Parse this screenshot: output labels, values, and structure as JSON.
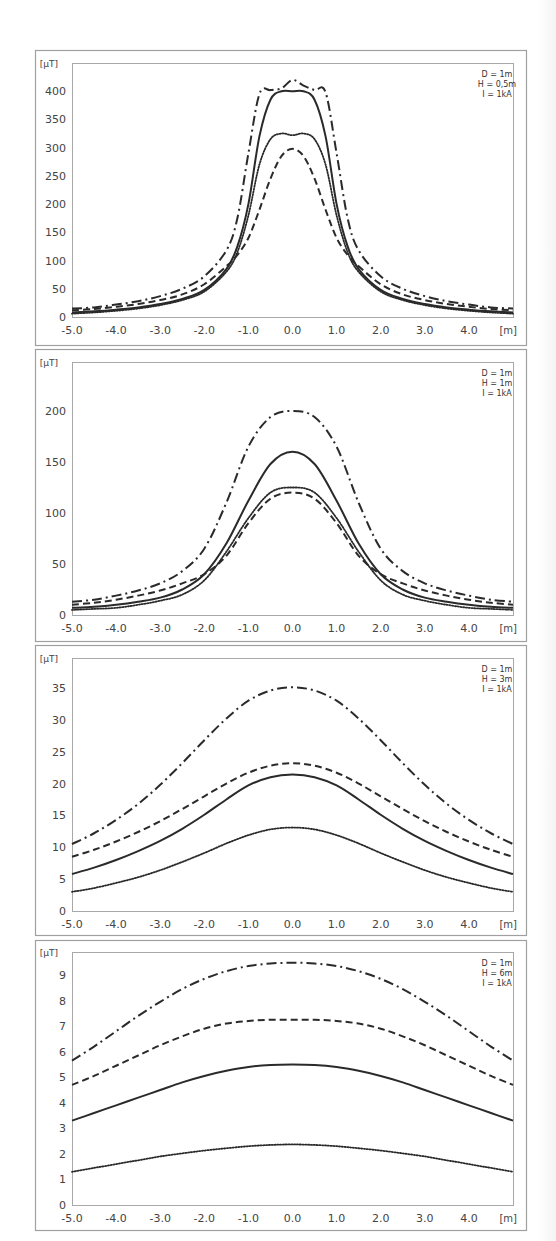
{
  "figure": {
    "unit_y": "[µT]",
    "unit_x": "[m]"
  },
  "chart_data": [
    {
      "type": "line",
      "title": "",
      "xlabel": "[m]",
      "ylabel": "[µT]",
      "annotation": [
        "D = 1m",
        "H = 0,5m",
        "I = 1kA"
      ],
      "xlim": [
        -5.0,
        5.0
      ],
      "ylim": [
        0,
        450
      ],
      "xticks": [
        "-5.0",
        "-4.0",
        "-3.0",
        "-2.0",
        "-1.0",
        "0.0",
        "1.0",
        "2.0",
        "3.0",
        "4.0"
      ],
      "yticks": [
        "0",
        "50",
        "100",
        "150",
        "200",
        "250",
        "300",
        "350",
        "400"
      ],
      "ytick_values": [
        0,
        50,
        100,
        150,
        200,
        250,
        300,
        350,
        400
      ],
      "grid": false,
      "legend": "none",
      "x": [
        -5.0,
        -4.5,
        -4.0,
        -3.5,
        -3.0,
        -2.5,
        -2.0,
        -1.5,
        -1.25,
        -1.0,
        -0.75,
        -0.5,
        -0.25,
        0.0,
        0.25,
        0.5,
        0.75,
        1.0,
        1.25,
        1.5,
        2.0,
        2.5,
        3.0,
        3.5,
        4.0,
        4.5,
        5.0
      ],
      "series": [
        {
          "name": "dash-dot",
          "style": "dashdot",
          "values": [
            15,
            17,
            22,
            28,
            37,
            50,
            72,
            118,
            175,
            290,
            395,
            402,
            405,
            420,
            410,
            402,
            398,
            290,
            175,
            118,
            72,
            50,
            37,
            28,
            22,
            17,
            15
          ]
        },
        {
          "name": "solid",
          "style": "solid",
          "values": [
            8,
            10,
            13,
            17,
            23,
            32,
            48,
            85,
            125,
            200,
            320,
            385,
            400,
            400,
            400,
            385,
            320,
            200,
            125,
            85,
            48,
            32,
            23,
            17,
            13,
            10,
            8
          ]
        },
        {
          "name": "dotted",
          "style": "dotted",
          "values": [
            6,
            8,
            11,
            15,
            21,
            30,
            45,
            80,
            115,
            180,
            270,
            315,
            325,
            322,
            325,
            315,
            270,
            180,
            115,
            80,
            45,
            30,
            21,
            15,
            11,
            8,
            6
          ]
        },
        {
          "name": "dashed",
          "style": "dashed",
          "values": [
            12,
            14,
            18,
            23,
            30,
            40,
            58,
            90,
            110,
            140,
            190,
            245,
            285,
            298,
            285,
            245,
            190,
            140,
            110,
            90,
            58,
            40,
            30,
            23,
            18,
            14,
            12
          ]
        }
      ]
    },
    {
      "type": "line",
      "title": "",
      "xlabel": "[m]",
      "ylabel": "[µT]",
      "annotation": [
        "D = 1m",
        "H = 1m",
        "I = 1kA"
      ],
      "xlim": [
        -5.0,
        5.0
      ],
      "ylim": [
        0,
        248
      ],
      "xticks": [
        "-5.0",
        "-4.0",
        "-3.0",
        "-2.0",
        "-1.0",
        "0.0",
        "1.0",
        "2.0",
        "3.0",
        "4.0"
      ],
      "yticks": [
        "0",
        "50",
        "100",
        "150",
        "200"
      ],
      "ytick_values": [
        0,
        50,
        100,
        150,
        200
      ],
      "grid": false,
      "legend": "none",
      "x": [
        -5.0,
        -4.5,
        -4.0,
        -3.5,
        -3.0,
        -2.5,
        -2.0,
        -1.5,
        -1.0,
        -0.5,
        0.0,
        0.5,
        1.0,
        1.5,
        2.0,
        2.5,
        3.0,
        3.5,
        4.0,
        4.5,
        5.0
      ],
      "series": [
        {
          "name": "dash-dot",
          "style": "dashdot",
          "values": [
            13,
            15,
            19,
            24,
            31,
            43,
            65,
            110,
            165,
            194,
            200,
            194,
            165,
            110,
            65,
            43,
            31,
            24,
            19,
            15,
            13
          ]
        },
        {
          "name": "solid",
          "style": "solid",
          "values": [
            7,
            8,
            10,
            13,
            17,
            25,
            40,
            70,
            112,
            148,
            160,
            148,
            112,
            70,
            40,
            25,
            17,
            13,
            10,
            8,
            7
          ]
        },
        {
          "name": "dotted",
          "style": "dotted",
          "values": [
            5,
            6,
            7,
            10,
            14,
            20,
            34,
            62,
            95,
            120,
            125,
            120,
            95,
            62,
            34,
            20,
            14,
            10,
            7,
            6,
            5
          ]
        },
        {
          "name": "dashed",
          "style": "dashed",
          "values": [
            10,
            12,
            15,
            19,
            24,
            31,
            40,
            58,
            90,
            114,
            120,
            114,
            90,
            58,
            40,
            31,
            24,
            19,
            15,
            12,
            10
          ]
        }
      ]
    },
    {
      "type": "line",
      "title": "",
      "xlabel": "[m]",
      "ylabel": "[µT]",
      "annotation": [
        "D = 1m",
        "H = 3m",
        "I = 1kA"
      ],
      "xlim": [
        -5.0,
        5.0
      ],
      "ylim": [
        0,
        39.7
      ],
      "xticks": [
        "-5.0",
        "-4.0",
        "-3.0",
        "-2.0",
        "-1.0",
        "0.0",
        "1.0",
        "2.0",
        "3.0",
        "4.0"
      ],
      "yticks": [
        "0",
        "5",
        "10",
        "15",
        "20",
        "25",
        "30",
        "35"
      ],
      "ytick_values": [
        0,
        5,
        10,
        15,
        20,
        25,
        30,
        35
      ],
      "grid": false,
      "legend": "none",
      "x": [
        -5.0,
        -4.5,
        -4.0,
        -3.5,
        -3.0,
        -2.5,
        -2.0,
        -1.5,
        -1.0,
        -0.5,
        0.0,
        0.5,
        1.0,
        1.5,
        2.0,
        2.5,
        3.0,
        3.5,
        4.0,
        4.5,
        5.0
      ],
      "series": [
        {
          "name": "dash-dot",
          "style": "dashdot",
          "values": [
            10.5,
            12.2,
            14.3,
            16.8,
            19.8,
            23.2,
            26.8,
            30.2,
            33.0,
            34.6,
            35.1,
            34.6,
            33.0,
            30.2,
            26.8,
            23.2,
            19.8,
            16.8,
            14.3,
            12.2,
            10.5
          ]
        },
        {
          "name": "dashed",
          "style": "dashed",
          "values": [
            8.5,
            9.6,
            10.9,
            12.4,
            14.1,
            16.0,
            18.0,
            20.0,
            21.7,
            22.8,
            23.2,
            22.8,
            21.7,
            20.0,
            18.0,
            16.0,
            14.1,
            12.4,
            10.9,
            9.6,
            8.5
          ]
        },
        {
          "name": "solid",
          "style": "solid",
          "values": [
            5.8,
            6.8,
            8.0,
            9.4,
            11.0,
            12.9,
            15.1,
            17.5,
            19.7,
            21.0,
            21.4,
            21.0,
            19.7,
            17.5,
            15.1,
            12.9,
            11.0,
            9.4,
            8.0,
            6.8,
            5.8
          ]
        },
        {
          "name": "dotted",
          "style": "dotted",
          "values": [
            3.0,
            3.6,
            4.4,
            5.3,
            6.4,
            7.7,
            9.1,
            10.6,
            11.9,
            12.8,
            13.1,
            12.8,
            11.9,
            10.6,
            9.1,
            7.7,
            6.4,
            5.3,
            4.4,
            3.6,
            3.0
          ]
        }
      ]
    },
    {
      "type": "line",
      "title": "",
      "xlabel": "[m]",
      "ylabel": "[µT]",
      "annotation": [
        "D = 1m",
        "H = 6m",
        "I = 1kA"
      ],
      "xlim": [
        -5.0,
        5.0
      ],
      "ylim": [
        0,
        9.9
      ],
      "xticks": [
        "-5.0",
        "-4.0",
        "-3.0",
        "-2.0",
        "-1.0",
        "0.0",
        "1.0",
        "2.0",
        "3.0",
        "4.0"
      ],
      "yticks": [
        "0",
        "1",
        "2",
        "3",
        "4",
        "5",
        "6",
        "7",
        "8",
        "9"
      ],
      "ytick_values": [
        0,
        1,
        2,
        3,
        4,
        5,
        6,
        7,
        8,
        9
      ],
      "grid": false,
      "legend": "none",
      "x": [
        -5.0,
        -4.5,
        -4.0,
        -3.5,
        -3.0,
        -2.5,
        -2.0,
        -1.5,
        -1.0,
        -0.5,
        0.0,
        0.5,
        1.0,
        1.5,
        2.0,
        2.5,
        3.0,
        3.5,
        4.0,
        4.5,
        5.0
      ],
      "series": [
        {
          "name": "dash-dot",
          "style": "dashdot",
          "values": [
            5.65,
            6.2,
            6.8,
            7.4,
            7.95,
            8.45,
            8.85,
            9.15,
            9.35,
            9.45,
            9.48,
            9.45,
            9.35,
            9.15,
            8.85,
            8.45,
            7.95,
            7.4,
            6.8,
            6.2,
            5.65
          ]
        },
        {
          "name": "dashed",
          "style": "dashed",
          "values": [
            4.7,
            5.05,
            5.45,
            5.85,
            6.25,
            6.6,
            6.9,
            7.1,
            7.2,
            7.25,
            7.25,
            7.25,
            7.2,
            7.1,
            6.9,
            6.6,
            6.25,
            5.85,
            5.45,
            5.05,
            4.7
          ]
        },
        {
          "name": "solid",
          "style": "solid",
          "values": [
            3.3,
            3.6,
            3.9,
            4.2,
            4.5,
            4.8,
            5.05,
            5.25,
            5.4,
            5.48,
            5.5,
            5.48,
            5.4,
            5.25,
            5.05,
            4.8,
            4.5,
            4.2,
            3.9,
            3.6,
            3.3
          ]
        },
        {
          "name": "dotted",
          "style": "dotted",
          "values": [
            1.3,
            1.45,
            1.6,
            1.75,
            1.9,
            2.02,
            2.13,
            2.22,
            2.3,
            2.35,
            2.37,
            2.35,
            2.3,
            2.22,
            2.13,
            2.02,
            1.9,
            1.75,
            1.6,
            1.45,
            1.3
          ]
        }
      ]
    }
  ]
}
